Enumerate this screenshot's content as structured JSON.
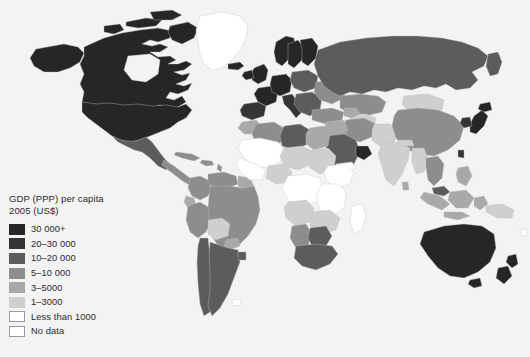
{
  "figure": {
    "kind": "choropleth-world-map",
    "background_color": "#f3f3f3",
    "ocean_color": "#f3f3f3",
    "border_color": "#c9c9c9"
  },
  "legend": {
    "title": "GDP (PPP) per capita\n2005 (US$)",
    "title_line1": "GDP (PPP) per capita",
    "title_line2": "2005 (US$)",
    "entries": [
      {
        "label": "30 000+",
        "color": "#262626"
      },
      {
        "label": "20–30 000",
        "color": "#353535"
      },
      {
        "label": "10–20 000",
        "color": "#5c5c5c"
      },
      {
        "label": "5–10 000",
        "color": "#8d8d8d"
      },
      {
        "label": "3–5000",
        "color": "#a9a9a9"
      },
      {
        "label": "1–3000",
        "color": "#cfcfcf"
      },
      {
        "label": "Less than 1000",
        "color": "#ffffff"
      },
      {
        "label": "No data",
        "color": "#ffffff"
      }
    ]
  },
  "chart_data": {
    "type": "map",
    "title": "GDP (PPP) per capita 2005 (US$)",
    "legend_position": "bottom-left",
    "categories": [
      "30 000+",
      "20–30 000",
      "10–20 000",
      "5–10 000",
      "3–5000",
      "1–3000",
      "Less than 1000",
      "No data"
    ],
    "colors": [
      "#262626",
      "#353535",
      "#5c5c5c",
      "#8d8d8d",
      "#a9a9a9",
      "#cfcfcf",
      "#ffffff",
      "#ffffff"
    ],
    "regions": [
      {
        "name": "United States",
        "category": "30 000+"
      },
      {
        "name": "Canada",
        "category": "30 000+"
      },
      {
        "name": "Greenland",
        "category": "No data"
      },
      {
        "name": "Mexico",
        "category": "10–20 000"
      },
      {
        "name": "Central America",
        "category": "5–10 000"
      },
      {
        "name": "Caribbean",
        "category": "5–10 000"
      },
      {
        "name": "Brazil",
        "category": "5–10 000"
      },
      {
        "name": "Argentina",
        "category": "10–20 000"
      },
      {
        "name": "Chile",
        "category": "10–20 000"
      },
      {
        "name": "Bolivia",
        "category": "3–5000"
      },
      {
        "name": "Colombia",
        "category": "5–10 000"
      },
      {
        "name": "Venezuela",
        "category": "5–10 000"
      },
      {
        "name": "Peru",
        "category": "5–10 000"
      },
      {
        "name": "Western Europe",
        "category": "30 000+"
      },
      {
        "name": "United Kingdom",
        "category": "30 000+"
      },
      {
        "name": "Norway",
        "category": "30 000+"
      },
      {
        "name": "Sweden",
        "category": "30 000+"
      },
      {
        "name": "Finland",
        "category": "30 000+"
      },
      {
        "name": "Spain",
        "category": "20–30 000"
      },
      {
        "name": "Italy",
        "category": "20–30 000"
      },
      {
        "name": "Eastern Europe",
        "category": "10–20 000"
      },
      {
        "name": "Russia",
        "category": "10–20 000"
      },
      {
        "name": "Ukraine",
        "category": "5–10 000"
      },
      {
        "name": "Turkey",
        "category": "5–10 000"
      },
      {
        "name": "Saudi Arabia",
        "category": "10–20 000"
      },
      {
        "name": "United Arab Emirates",
        "category": "30 000+"
      },
      {
        "name": "Iran",
        "category": "5–10 000"
      },
      {
        "name": "Kazakhstan",
        "category": "5–10 000"
      },
      {
        "name": "China",
        "category": "5–10 000"
      },
      {
        "name": "India",
        "category": "3–5000"
      },
      {
        "name": "Pakistan",
        "category": "1–3000"
      },
      {
        "name": "Bangladesh",
        "category": "1–3000"
      },
      {
        "name": "Japan",
        "category": "30 000+"
      },
      {
        "name": "South Korea",
        "category": "20–30 000"
      },
      {
        "name": "Mongolia",
        "category": "1–3000"
      },
      {
        "name": "Indonesia",
        "category": "3–5000"
      },
      {
        "name": "Malaysia",
        "category": "10–20 000"
      },
      {
        "name": "Thailand",
        "category": "5–10 000"
      },
      {
        "name": "Vietnam",
        "category": "1–3000"
      },
      {
        "name": "Philippines",
        "category": "3–5000"
      },
      {
        "name": "Australia",
        "category": "30 000+"
      },
      {
        "name": "New Zealand",
        "category": "30 000+"
      },
      {
        "name": "Papua New Guinea",
        "category": "1–3000"
      },
      {
        "name": "North Africa",
        "category": "5–10 000"
      },
      {
        "name": "Libya",
        "category": "10–20 000"
      },
      {
        "name": "Egypt",
        "category": "3–5000"
      },
      {
        "name": "Algeria",
        "category": "5–10 000"
      },
      {
        "name": "Sub-Saharan Africa",
        "category": "Less than 1000"
      },
      {
        "name": "South Africa",
        "category": "5–10 000"
      },
      {
        "name": "Botswana",
        "category": "10–20 000"
      },
      {
        "name": "Namibia",
        "category": "5–10 000"
      },
      {
        "name": "Nigeria",
        "category": "1–3000"
      },
      {
        "name": "Angola",
        "category": "1–3000"
      },
      {
        "name": "Sudan",
        "category": "1–3000"
      }
    ]
  }
}
